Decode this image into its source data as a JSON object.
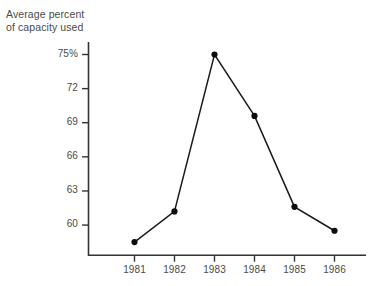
{
  "chart_data": {
    "type": "line",
    "title": "Average percent\nof capacity used",
    "xlabel": "",
    "ylabel": "",
    "categories": [
      "1981",
      "1982",
      "1983",
      "1984",
      "1985",
      "1986"
    ],
    "values": [
      58.5,
      61.2,
      75.0,
      69.6,
      61.6,
      59.5
    ],
    "series": [
      {
        "name": "Average percent of capacity used",
        "values": [
          58.5,
          61.2,
          75.0,
          69.6,
          61.6,
          59.5
        ]
      }
    ],
    "y_ticks": [
      {
        "value": 75,
        "label": "75%"
      },
      {
        "value": 72,
        "label": "72"
      },
      {
        "value": 69,
        "label": "69"
      },
      {
        "value": 66,
        "label": "66"
      },
      {
        "value": 63,
        "label": "63"
      },
      {
        "value": 60,
        "label": "60"
      }
    ],
    "x_ticks": [
      "1981",
      "1982",
      "1983",
      "1984",
      "1985",
      "1986"
    ],
    "ylim": [
      57.35,
      76.1
    ],
    "grid": false,
    "legend": "none",
    "marker": "circle",
    "line_color": "#1a1a1a",
    "marker_color": "#0d0d0d",
    "axis_color": "#333333",
    "background": "#ffffff"
  },
  "axes": {
    "title_text": "Average percent\nof capacity used"
  }
}
